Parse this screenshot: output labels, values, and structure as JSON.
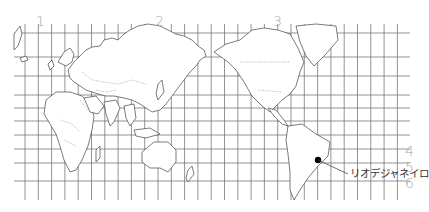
{
  "map": {
    "projection": "world-mercator-pacific-centered",
    "column_labels": [
      {
        "text": "1",
        "x": 36,
        "y": 14
      },
      {
        "text": "2",
        "x": 155,
        "y": 14
      },
      {
        "text": "3",
        "x": 273,
        "y": 14
      }
    ],
    "row_labels": [
      {
        "text": "4",
        "x": 405,
        "y": 144
      },
      {
        "text": "5",
        "x": 405,
        "y": 160
      },
      {
        "text": "6",
        "x": 405,
        "y": 176
      }
    ],
    "marker": {
      "label": "リオデジャネイロ",
      "x": 318,
      "y": 160,
      "label_x": 350,
      "label_y": 173
    },
    "grid": {
      "vertical_x_start": 25,
      "vertical_spacing": 13.3,
      "vertical_count": 30,
      "horizontal_ys": [
        33,
        57,
        76,
        95,
        108,
        121,
        135,
        149,
        163,
        181
      ],
      "top": 24,
      "bottom": 200,
      "left": 14,
      "right": 410
    },
    "colors": {
      "grid": "#666666",
      "land_stroke": "#444444",
      "label": "#a9a9a9",
      "marker": "#000000"
    }
  }
}
